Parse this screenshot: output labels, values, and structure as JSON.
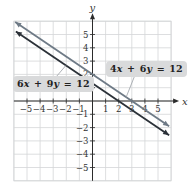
{
  "chart_data": {
    "type": "line",
    "title": "",
    "xlabel": "x",
    "ylabel": "y",
    "xlim": [
      -6,
      6
    ],
    "ylim": [
      -6,
      6
    ],
    "grid": true,
    "x_ticks": [
      -5,
      -4,
      -3,
      -2,
      -1,
      1,
      2,
      3,
      4,
      5
    ],
    "y_ticks": [
      -5,
      -4,
      -3,
      -2,
      -1,
      1,
      2,
      3,
      4,
      5
    ],
    "series": [
      {
        "name": "4x + 6y = 12",
        "equation": "4x + 6y = 12",
        "slope": -0.6667,
        "y_intercept": 2,
        "x_intercept": 3,
        "color": "#6e7a86",
        "points": [
          [
            -6,
            6
          ],
          [
            0,
            2
          ],
          [
            3,
            0
          ],
          [
            6,
            -2
          ]
        ]
      },
      {
        "name": "6x + 9y = 12",
        "equation": "6x + 9y = 12",
        "slope": -0.6667,
        "y_intercept": 1.3333,
        "x_intercept": 2,
        "color": "#2b3138",
        "points": [
          [
            -6,
            5.3333
          ],
          [
            0,
            1.3333
          ],
          [
            2,
            0
          ],
          [
            6,
            -2.6667
          ]
        ]
      }
    ]
  },
  "labels": {
    "upper": "4x + 6y = 12",
    "lower": "6x + 9y = 12"
  },
  "axes": {
    "x_name": "x",
    "y_name": "y"
  },
  "colors": {
    "grid": "#d4d6d8",
    "axis": "#2b2b2b",
    "label_bg": "#d9dadb"
  }
}
